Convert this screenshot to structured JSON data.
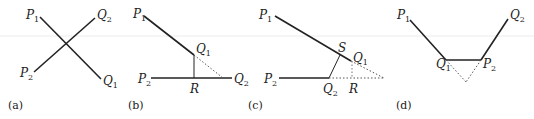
{
  "figure": {
    "panels": [
      {
        "caption": "(a)",
        "labels": {
          "p1": "P",
          "p1_sub": "1",
          "q2": "Q",
          "q2_sub": "2",
          "p2": "P",
          "p2_sub": "2",
          "q1": "Q",
          "q1_sub": "1"
        }
      },
      {
        "caption": "(b)",
        "labels": {
          "p1": "P",
          "p1_sub": "1",
          "q1": "Q",
          "q1_sub": "1",
          "p2": "P",
          "p2_sub": "2",
          "q2": "Q",
          "q2_sub": "2",
          "r": "R"
        }
      },
      {
        "caption": "(c)",
        "labels": {
          "p1": "P",
          "p1_sub": "1",
          "s": "S",
          "q1": "Q",
          "q1_sub": "1",
          "p2": "P",
          "p2_sub": "2",
          "q2": "Q",
          "q2_sub": "2",
          "r": "R"
        }
      },
      {
        "caption": "(d)",
        "labels": {
          "p1": "P",
          "p1_sub": "1",
          "q1": "Q",
          "q1_sub": "1",
          "p2": "P",
          "p2_sub": "2",
          "q2": "Q",
          "q2_sub": "2"
        }
      }
    ],
    "colors": {
      "line": "#222222",
      "dotted": "#555555",
      "background": "#ffffff"
    }
  }
}
